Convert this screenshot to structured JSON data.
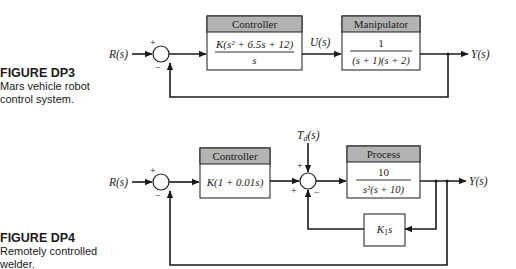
{
  "figures": [
    {
      "id": "DP3",
      "label": "FIGURE DP3",
      "caption_line1": "Mars vehicle robot",
      "caption_line2": "control system.",
      "input": "R(s)",
      "output": "Y(s)",
      "signals": {
        "u": "U(s)"
      },
      "sum_signs": {
        "top": "+",
        "bottom": "−"
      },
      "blocks": [
        {
          "title": "Controller",
          "num": "K(s² + 6.5s + 12)",
          "den": "s"
        },
        {
          "title": "Manipulator",
          "num": "1",
          "den": "(s + 1)(s + 2)"
        }
      ]
    },
    {
      "id": "DP4",
      "label": "FIGURE DP4",
      "caption_line1": "Remotely controlled",
      "caption_line2": "welder.",
      "input": "R(s)",
      "output": "Y(s)",
      "disturbance": "Td(s)",
      "sum1_signs": {
        "top": "+",
        "bottom": "−"
      },
      "sum2_signs": {
        "top": "+",
        "left": "+",
        "bottom": "−"
      },
      "blocks": [
        {
          "title": "Controller",
          "expr": "K(1 + 0.01s)"
        },
        {
          "title": "Process",
          "num": "10",
          "den": "s²(s + 10)"
        },
        {
          "title": "",
          "expr": "K1s"
        }
      ]
    }
  ],
  "colors": {
    "line": "#1a1a1a",
    "header": "#b3b3b3",
    "box_fill": "#ffffff"
  }
}
